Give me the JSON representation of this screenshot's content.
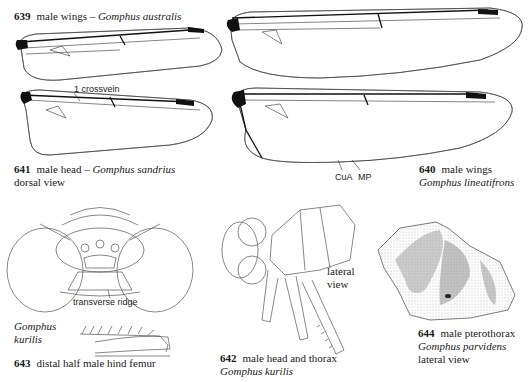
{
  "figures": [
    {
      "id": "639",
      "number": "639",
      "title": "male wings – ",
      "species": "Gomphus australis"
    },
    {
      "id": "640",
      "number": "640",
      "title": "male wings",
      "species": "Gomphus lineatifrons",
      "labels": [
        "CuA",
        "MP"
      ]
    },
    {
      "id": "641",
      "number": "641",
      "title": "male head – ",
      "species": "Gomphus sandrius",
      "subtitle": "dorsal view",
      "labels": [
        "transverse ridge"
      ]
    },
    {
      "id": "642",
      "number": "642",
      "title": "male head and thorax",
      "species": "Gomphus kurilis",
      "labels": [
        "lateral",
        "view"
      ]
    },
    {
      "id": "643",
      "number": "643",
      "title": "distal half male hind femur",
      "species_line1": "Gomphus",
      "species_line2": "kurilis"
    },
    {
      "id": "644",
      "number": "644",
      "title": "male pterothorax",
      "species": "Gomphus parvidens",
      "subtitle": "lateral view"
    }
  ],
  "annotations": {
    "crossvein": "1 crossvein"
  }
}
